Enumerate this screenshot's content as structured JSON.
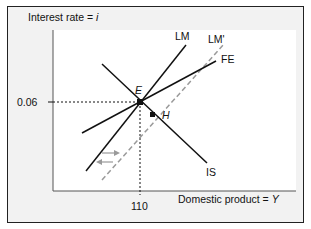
{
  "diagram": {
    "type": "IS-LM-FE model",
    "y_axis_label_prefix": "Interest rate = ",
    "y_axis_label_var": "i",
    "x_axis_label_prefix": "Domestic product = ",
    "x_axis_label_var": "Y",
    "y_tick": "0.06",
    "x_tick": "110",
    "curves": {
      "LM": "LM",
      "LM_shifted": "LM'",
      "FE": "FE",
      "IS": "IS"
    },
    "points": {
      "E": "E",
      "H": "H"
    },
    "colors": {
      "curve": "#111111",
      "shifted_curve": "#9a9a9a",
      "background": "#f2f2f2",
      "plot_area": "#ffffff"
    }
  }
}
